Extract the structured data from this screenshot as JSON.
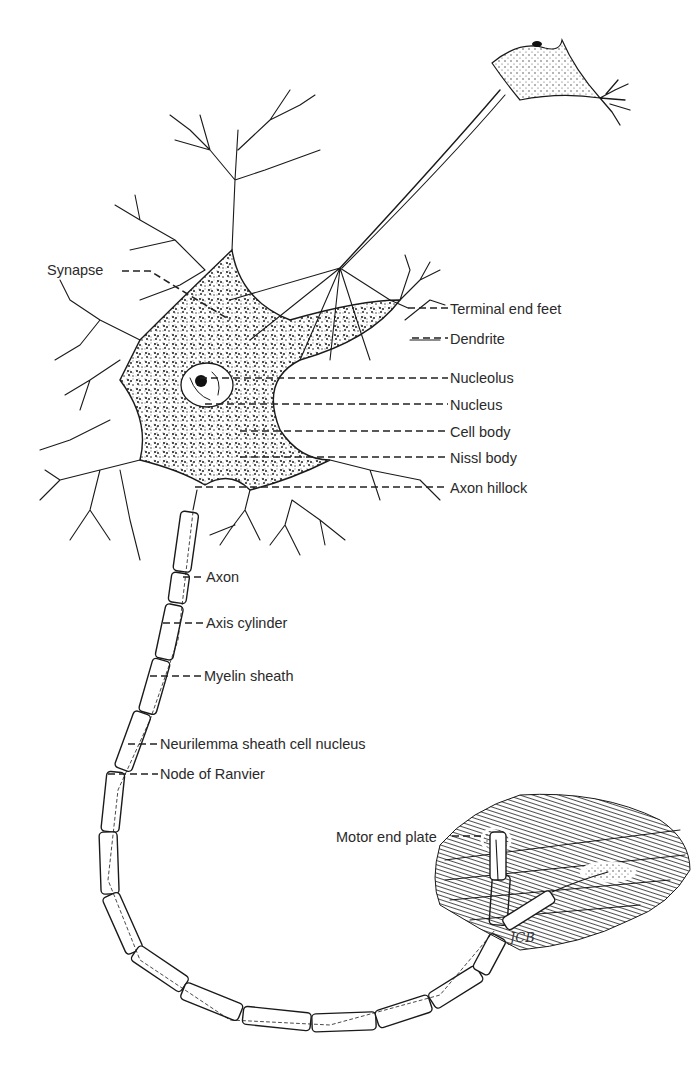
{
  "diagram": {
    "labels": [
      {
        "id": "synapse",
        "text": "Synapse",
        "x": 47,
        "y": 262,
        "side": "left",
        "target": [
          230,
          320
        ]
      },
      {
        "id": "terminal-end-feet",
        "text": "Terminal end feet",
        "x": 450,
        "y": 301,
        "side": "right",
        "target": [
          408,
          308
        ]
      },
      {
        "id": "dendrite",
        "text": "Dendrite",
        "x": 450,
        "y": 331,
        "side": "right",
        "target": [
          412,
          338
        ]
      },
      {
        "id": "nucleolus",
        "text": "Nucleolus",
        "x": 450,
        "y": 370,
        "side": "right",
        "target": [
          200,
          378
        ]
      },
      {
        "id": "nucleus",
        "text": "Nucleus",
        "x": 450,
        "y": 397,
        "side": "right",
        "target": [
          205,
          404
        ]
      },
      {
        "id": "cell-body",
        "text": "Cell body",
        "x": 450,
        "y": 424,
        "side": "right",
        "target": [
          240,
          431
        ]
      },
      {
        "id": "nissl-body",
        "text": "Nissl body",
        "x": 450,
        "y": 450,
        "side": "right",
        "target": [
          240,
          457
        ]
      },
      {
        "id": "axon-hillock",
        "text": "Axon hillock",
        "x": 450,
        "y": 480,
        "side": "right",
        "target": [
          195,
          487
        ]
      },
      {
        "id": "axon",
        "text": "Axon",
        "x": 206,
        "y": 569,
        "side": "right",
        "target": [
          183,
          577
        ]
      },
      {
        "id": "axis-cylinder",
        "text": "Axis cylinder",
        "x": 206,
        "y": 615,
        "side": "right",
        "target": [
          163,
          623
        ]
      },
      {
        "id": "myelin-sheath",
        "text": "Myelin sheath",
        "x": 204,
        "y": 668,
        "side": "right",
        "target": [
          150,
          676
        ]
      },
      {
        "id": "neurilemma-sheath-cell-nucleus",
        "text": "Neurilemma sheath cell nucleus",
        "x": 160,
        "y": 736,
        "side": "right",
        "target": [
          128,
          744
        ]
      },
      {
        "id": "node-of-ranvier",
        "text": "Node of Ranvier",
        "x": 160,
        "y": 766,
        "side": "right",
        "target": [
          108,
          774
        ]
      },
      {
        "id": "motor-end-plate",
        "text": "Motor end plate",
        "x": 336,
        "y": 829,
        "side": "left",
        "target": [
          485,
          836
        ]
      }
    ],
    "signature": "JCB"
  }
}
